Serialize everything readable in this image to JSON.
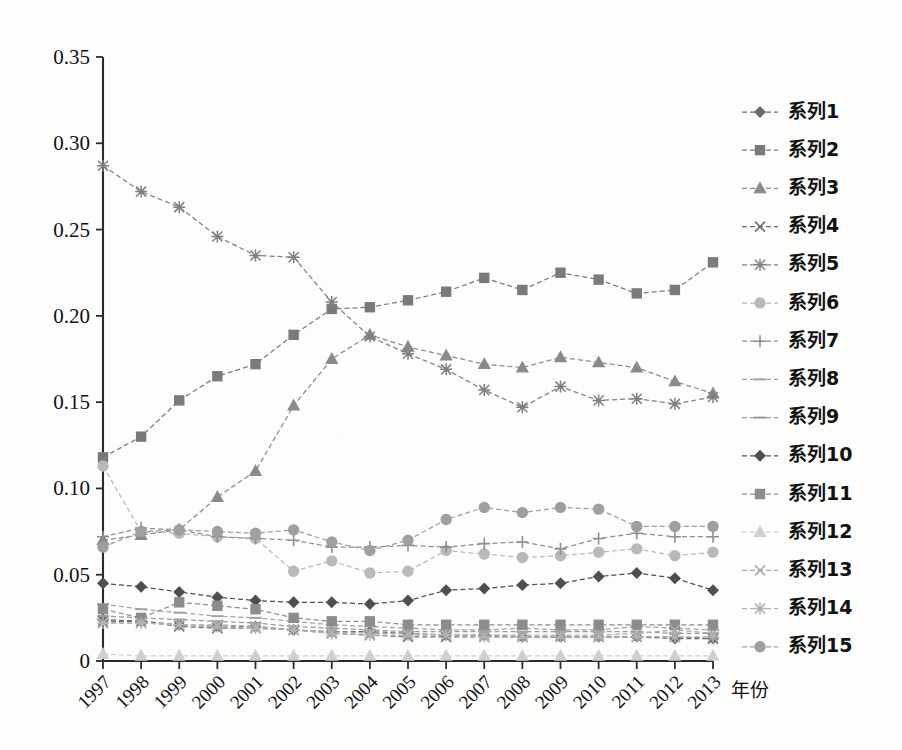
{
  "chart_data": {
    "type": "line",
    "title": "",
    "xlabel": "年份",
    "ylabel": "",
    "grid": false,
    "legend_position": "right",
    "x": [
      1997,
      1998,
      1999,
      2000,
      2001,
      2002,
      2003,
      2004,
      2005,
      2006,
      2007,
      2008,
      2009,
      2010,
      2011,
      2012,
      2013
    ],
    "xtick_labels": [
      "1997",
      "1998",
      "1999",
      "2000",
      "2001",
      "2002",
      "2003",
      "2004",
      "2005",
      "2006",
      "2007",
      "2008",
      "2009",
      "2010",
      "2011",
      "2012",
      "2013"
    ],
    "ytick_labels": [
      "0",
      "0.05",
      "0.10",
      "0.15",
      "0.20",
      "0.25",
      "0.30",
      "0.35"
    ],
    "ytick_values": [
      0,
      0.05,
      0.1,
      0.15,
      0.2,
      0.25,
      0.3,
      0.35
    ],
    "ylim": [
      0,
      0.35
    ],
    "xlim": [
      1997,
      2013
    ],
    "series": [
      {
        "name": "系列1",
        "marker": "diamond",
        "values": [
          0.024,
          0.023,
          0.021,
          0.02,
          0.02,
          0.018,
          0.017,
          0.017,
          0.016,
          0.015,
          0.015,
          0.014,
          0.014,
          0.014,
          0.014,
          0.013,
          0.013
        ]
      },
      {
        "name": "系列2",
        "marker": "square",
        "values": [
          0.118,
          0.13,
          0.151,
          0.165,
          0.172,
          0.189,
          0.204,
          0.205,
          0.209,
          0.214,
          0.222,
          0.215,
          0.225,
          0.221,
          0.213,
          0.215,
          0.231
        ]
      },
      {
        "name": "系列3",
        "marker": "triangle",
        "values": [
          0.07,
          0.073,
          0.076,
          0.095,
          0.11,
          0.148,
          0.175,
          0.189,
          0.182,
          0.177,
          0.172,
          0.17,
          0.176,
          0.173,
          0.17,
          0.162,
          0.155
        ]
      },
      {
        "name": "系列4",
        "marker": "cross-x",
        "values": [
          0.023,
          0.023,
          0.02,
          0.019,
          0.019,
          0.018,
          0.016,
          0.015,
          0.014,
          0.014,
          0.014,
          0.014,
          0.014,
          0.014,
          0.014,
          0.014,
          0.013
        ]
      },
      {
        "name": "系列5",
        "marker": "star",
        "values": [
          0.287,
          0.272,
          0.263,
          0.246,
          0.235,
          0.234,
          0.208,
          0.188,
          0.178,
          0.169,
          0.157,
          0.147,
          0.159,
          0.151,
          0.152,
          0.149,
          0.153
        ]
      },
      {
        "name": "系列6",
        "marker": "circle",
        "values": [
          0.113,
          0.075,
          0.074,
          0.072,
          0.071,
          0.052,
          0.058,
          0.051,
          0.052,
          0.064,
          0.062,
          0.06,
          0.061,
          0.063,
          0.065,
          0.061,
          0.063
        ]
      },
      {
        "name": "系列7",
        "marker": "plus",
        "values": [
          0.072,
          0.077,
          0.076,
          0.072,
          0.071,
          0.07,
          0.066,
          0.066,
          0.067,
          0.066,
          0.068,
          0.069,
          0.065,
          0.071,
          0.074,
          0.072,
          0.072
        ]
      },
      {
        "name": "系列8",
        "marker": "dash",
        "values": [
          0.033,
          0.03,
          0.028,
          0.026,
          0.025,
          0.023,
          0.021,
          0.02,
          0.019,
          0.018,
          0.018,
          0.019,
          0.018,
          0.018,
          0.02,
          0.019,
          0.018
        ]
      },
      {
        "name": "系列9",
        "marker": "dash",
        "values": [
          0.026,
          0.025,
          0.024,
          0.023,
          0.022,
          0.02,
          0.019,
          0.018,
          0.017,
          0.017,
          0.017,
          0.017,
          0.017,
          0.017,
          0.017,
          0.016,
          0.016
        ]
      },
      {
        "name": "系列10",
        "marker": "diamond",
        "values": [
          0.045,
          0.043,
          0.04,
          0.037,
          0.035,
          0.034,
          0.034,
          0.033,
          0.035,
          0.041,
          0.042,
          0.044,
          0.045,
          0.049,
          0.051,
          0.048,
          0.041
        ]
      },
      {
        "name": "系列11",
        "marker": "square",
        "values": [
          0.03,
          0.025,
          0.034,
          0.032,
          0.03,
          0.025,
          0.023,
          0.023,
          0.021,
          0.021,
          0.021,
          0.021,
          0.021,
          0.021,
          0.021,
          0.021,
          0.021
        ]
      },
      {
        "name": "系列12",
        "marker": "triangle",
        "values": [
          0.004,
          0.003,
          0.003,
          0.003,
          0.003,
          0.003,
          0.003,
          0.003,
          0.003,
          0.003,
          0.003,
          0.003,
          0.003,
          0.003,
          0.003,
          0.003,
          0.003
        ]
      },
      {
        "name": "系列13",
        "marker": "cross-x",
        "values": [
          0.022,
          0.022,
          0.021,
          0.021,
          0.02,
          0.018,
          0.017,
          0.016,
          0.016,
          0.015,
          0.015,
          0.015,
          0.015,
          0.015,
          0.016,
          0.018,
          0.016
        ]
      },
      {
        "name": "系列14",
        "marker": "star",
        "values": [
          0.022,
          0.022,
          0.021,
          0.02,
          0.019,
          0.018,
          0.016,
          0.015,
          0.015,
          0.015,
          0.014,
          0.014,
          0.014,
          0.014,
          0.014,
          0.014,
          0.014
        ]
      },
      {
        "name": "系列15",
        "marker": "circle",
        "values": [
          0.066,
          0.075,
          0.076,
          0.075,
          0.074,
          0.076,
          0.069,
          0.064,
          0.07,
          0.082,
          0.089,
          0.086,
          0.089,
          0.088,
          0.078,
          0.078,
          0.078
        ]
      }
    ]
  },
  "legend": {
    "items": [
      {
        "label": "系列1"
      },
      {
        "label": "系列2"
      },
      {
        "label": "系列3"
      },
      {
        "label": "系列4"
      },
      {
        "label": "系列5"
      },
      {
        "label": "系列6"
      },
      {
        "label": "系列7"
      },
      {
        "label": "系列8"
      },
      {
        "label": "系列9"
      },
      {
        "label": "系列10"
      },
      {
        "label": "系列11"
      },
      {
        "label": "系列12"
      },
      {
        "label": "系列13"
      },
      {
        "label": "系列14"
      },
      {
        "label": "系列15"
      }
    ]
  },
  "colors": {
    "axis": "#2b2b2b",
    "text": "#111111",
    "series": [
      "#6b6b6b",
      "#7a7a7a",
      "#8a8a8a",
      "#6e6e6e",
      "#7f7f7f",
      "#b9b9b9",
      "#8f8f8f",
      "#a3a3a3",
      "#9a9a9a",
      "#4f4f4f",
      "#8c8c8c",
      "#cfcfcf",
      "#a8a8a8",
      "#b2b2b2",
      "#9f9f9f"
    ]
  }
}
